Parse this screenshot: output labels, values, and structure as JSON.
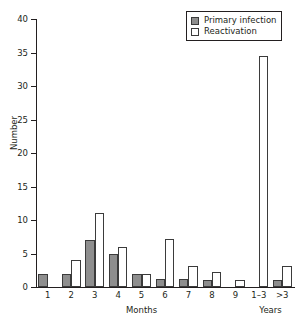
{
  "chart_data": {
    "type": "bar",
    "title": "",
    "xlabel": "",
    "ylabel": "Number",
    "ylim": [
      0,
      40
    ],
    "yticks": [
      0,
      5,
      10,
      15,
      20,
      25,
      30,
      35,
      40
    ],
    "grid": false,
    "legend_position": "top-right",
    "categories": [
      "1",
      "2",
      "3",
      "4",
      "5",
      "6",
      "7",
      "8",
      "9",
      "1–3",
      ">3"
    ],
    "group_labels": [
      {
        "text": "Months",
        "spans": [
          "1",
          "2",
          "3",
          "4",
          "5",
          "6",
          "7",
          "8",
          "9"
        ]
      },
      {
        "text": "Years",
        "spans": [
          "1–3",
          ">3"
        ]
      }
    ],
    "series": [
      {
        "name": "Primary infection",
        "color": "#8e8e8e",
        "values": [
          2,
          2,
          7,
          5,
          2,
          1.2,
          1.2,
          1,
          0,
          0,
          1
        ]
      },
      {
        "name": "Reactivation",
        "color": "#ffffff",
        "values": [
          0,
          4,
          11,
          6,
          2,
          7.2,
          3.2,
          2.2,
          1,
          34.5,
          3.1
        ]
      }
    ]
  },
  "legend": {
    "items": [
      {
        "label": "Primary infection",
        "swatch": "filled-gray"
      },
      {
        "label": "Reactivation",
        "swatch": "open-white"
      }
    ]
  },
  "axes": {
    "y_title": "Number",
    "y_tick_labels": [
      "40",
      "35",
      "30",
      "25",
      "20",
      "15",
      "10",
      "5",
      "0"
    ]
  },
  "colors": {
    "primary_fill": "#8e8e8e",
    "reactivation_fill": "#ffffff",
    "stroke": "#3b3b3b",
    "axis": "#231f20",
    "background": "#ffffff"
  }
}
